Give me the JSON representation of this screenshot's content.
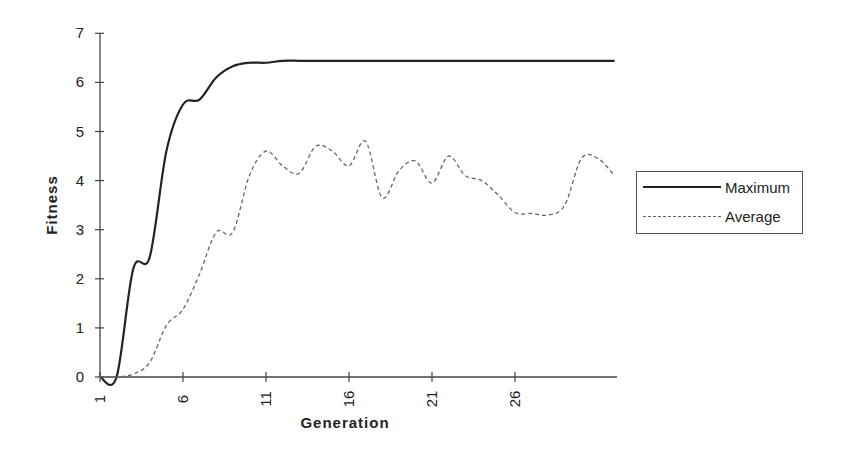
{
  "chart_data": {
    "type": "line",
    "title": "",
    "xlabel": "Generation",
    "ylabel": "Fitness",
    "x": [
      1,
      2,
      3,
      4,
      5,
      6,
      7,
      8,
      9,
      10,
      11,
      12,
      13,
      14,
      15,
      16,
      17,
      18,
      19,
      20,
      21,
      22,
      23,
      24,
      25,
      26,
      27,
      28,
      29,
      30,
      31,
      32
    ],
    "x_tick_labels": [
      "1",
      "6",
      "11",
      "16",
      "21",
      "26"
    ],
    "y_tick_labels": [
      "0",
      "1",
      "2",
      "3",
      "4",
      "5",
      "6",
      "7"
    ],
    "ylim": [
      0,
      7
    ],
    "xlim": [
      1,
      32
    ],
    "grid": false,
    "legend_position": "right",
    "series": [
      {
        "name": "Maximum",
        "style": "solid",
        "color": "#222222",
        "values": [
          0,
          0,
          2.2,
          2.45,
          4.6,
          5.55,
          5.65,
          6.1,
          6.33,
          6.4,
          6.4,
          6.44,
          6.44,
          6.44,
          6.44,
          6.44,
          6.44,
          6.44,
          6.44,
          6.44,
          6.44,
          6.44,
          6.44,
          6.44,
          6.44,
          6.44,
          6.44,
          6.44,
          6.44,
          6.44,
          6.44,
          6.44
        ]
      },
      {
        "name": "Average",
        "style": "dashed",
        "color": "#666666",
        "values": [
          0,
          0,
          0.06,
          0.3,
          1.05,
          1.38,
          2.1,
          2.95,
          2.95,
          4.1,
          4.6,
          4.3,
          4.15,
          4.7,
          4.6,
          4.3,
          4.8,
          3.65,
          4.2,
          4.4,
          3.95,
          4.5,
          4.1,
          4.0,
          3.7,
          3.35,
          3.33,
          3.3,
          3.5,
          4.45,
          4.45,
          4.1
        ]
      }
    ]
  },
  "legend": {
    "items": [
      {
        "label": "Maximum"
      },
      {
        "label": "Average"
      }
    ]
  }
}
